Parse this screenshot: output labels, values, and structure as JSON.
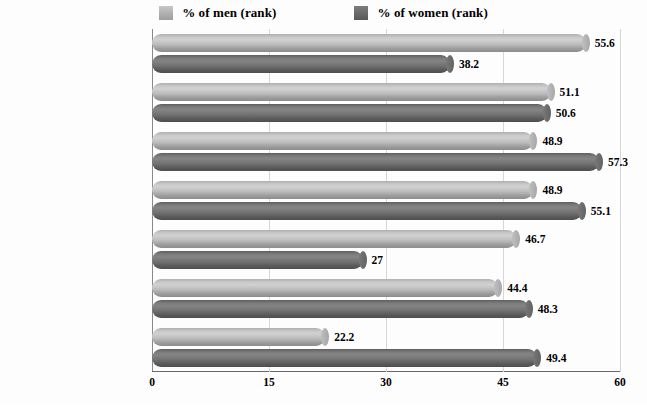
{
  "legend": {
    "position": "top-center",
    "items": [
      {
        "label": "% of men (rank)",
        "key": "men",
        "color": "#c0c0c0",
        "swatch": "men-color-swatch"
      },
      {
        "label": "% of women (rank)",
        "key": "women",
        "color": "#6d6d6d",
        "swatch": "women-color-swatch"
      }
    ]
  },
  "axis": {
    "x_ticks": [
      "0",
      "15",
      "30",
      "45",
      "60"
    ]
  },
  "chart_data": {
    "type": "bar",
    "orientation": "horizontal",
    "title": "",
    "subtitle": "",
    "xlabel": "",
    "ylabel": "",
    "xlim": [
      0,
      60
    ],
    "xticks": [
      0,
      15,
      30,
      45,
      60
    ],
    "grid": true,
    "legend_position": "top-center",
    "categories": [
      "Loss of love",
      "Personality differences",
      "Frequent quarrels",
      "Lack of communication",
      "Nagging/complaining",
      "Loss of trust",
      "Verbal and emotional abuse"
    ],
    "series": [
      {
        "name": "% of men (rank)",
        "color": "#c0c0c0",
        "values": [
          55.6,
          51.1,
          48.9,
          48.9,
          46.7,
          44.4,
          22.2
        ],
        "labels": [
          "55.6",
          "51.1",
          "48.9",
          "48.9",
          "46.7",
          "44.4",
          "22.2"
        ]
      },
      {
        "name": "% of women (rank)",
        "color": "#6d6d6d",
        "values": [
          38.2,
          50.6,
          57.3,
          55.1,
          27,
          48.3,
          49.4
        ],
        "labels": [
          "38.2",
          "50.6",
          "57.3",
          "55.1",
          "27",
          "48.3",
          "49.4"
        ]
      }
    ]
  }
}
